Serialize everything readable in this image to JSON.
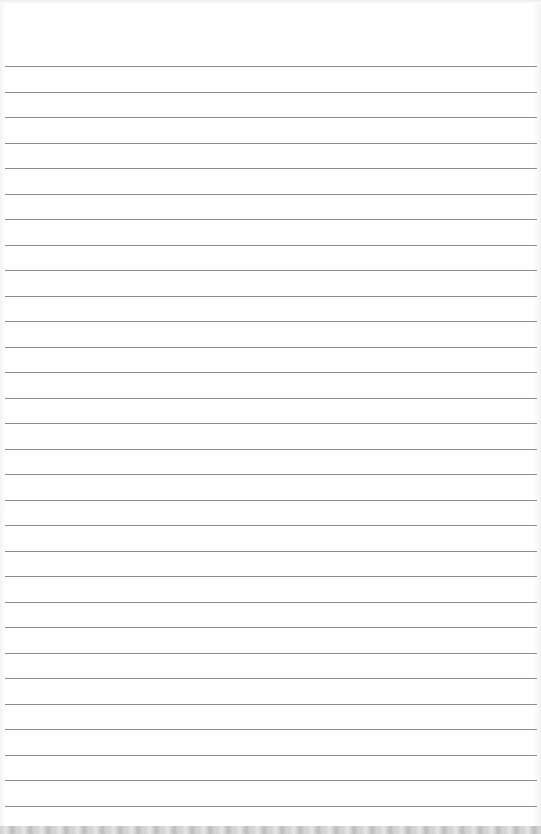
{
  "image": {
    "subject": "lined-paper-sheet",
    "background_color": "#ffffff",
    "rule_color": "#8d8d8d",
    "rule_count": 30,
    "first_rule_y": 66,
    "rule_spacing": 25.5,
    "rule_left": 5,
    "rule_width": 532
  }
}
